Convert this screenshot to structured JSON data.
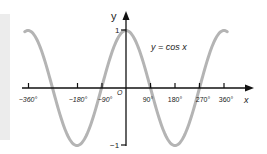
{
  "chart_data": {
    "type": "line",
    "title": "",
    "annotation": "y = cos x",
    "xlabel": "x",
    "ylabel": "y",
    "x_ticks": [
      {
        "value": -360,
        "label": "−360°"
      },
      {
        "value": -180,
        "label": "−180°"
      },
      {
        "value": -90,
        "label": "−90°"
      },
      {
        "value": 90,
        "label": "90°"
      },
      {
        "value": 180,
        "label": "180°"
      },
      {
        "value": 270,
        "label": "270°"
      },
      {
        "value": 360,
        "label": "360°"
      }
    ],
    "y_ticks": [
      {
        "value": 1,
        "label": "1"
      },
      {
        "value": -1,
        "label": "−1"
      }
    ],
    "origin_label": "O",
    "xlim": [
      -360,
      360
    ],
    "ylim": [
      -1,
      1
    ],
    "grid": false,
    "series": [
      {
        "name": "y = cos x",
        "color": "#b4b4b4",
        "x": [
          -360,
          -270,
          -180,
          -90,
          0,
          90,
          180,
          270,
          360
        ],
        "y": [
          1,
          0,
          -1,
          0,
          1,
          0,
          -1,
          0,
          1
        ]
      }
    ]
  },
  "labels": {
    "function": "y = cos x",
    "x_axis": "x",
    "y_axis": "y",
    "origin": "O",
    "y_one": "1",
    "y_minus_one": "−1",
    "t_m360": "−360°",
    "t_m180": "−180°",
    "t_m90": "−90°",
    "t_90": "90°",
    "t_180": "180°",
    "t_270": "270°",
    "t_360": "360°"
  }
}
